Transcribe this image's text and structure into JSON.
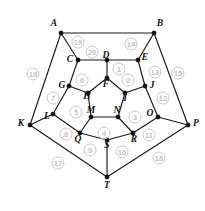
{
  "diagram": {
    "type": "planar-graph",
    "width": 205,
    "height": 211,
    "colors": {
      "edge": "#1a1a1a",
      "vertex": "#111111",
      "vertex_label": "#111111",
      "face_label": "#c2c2c2",
      "face_circle": "#c9c9c9",
      "background": "#ffffff"
    },
    "vertices": [
      {
        "id": "A",
        "label": "A",
        "x": 61,
        "y": 33,
        "lx": 54,
        "ly": 24
      },
      {
        "id": "B",
        "label": "B",
        "x": 154,
        "y": 33,
        "lx": 160,
        "ly": 24
      },
      {
        "id": "C",
        "label": "C",
        "x": 78,
        "y": 60,
        "lx": 70,
        "ly": 60
      },
      {
        "id": "D",
        "label": "D",
        "x": 107,
        "y": 60,
        "lx": 106,
        "ly": 56
      },
      {
        "id": "E",
        "label": "E",
        "x": 138,
        "y": 60,
        "lx": 145,
        "ly": 58
      },
      {
        "id": "F",
        "label": "F",
        "x": 107,
        "y": 78,
        "lx": 106,
        "ly": 85
      },
      {
        "id": "G",
        "label": "G",
        "x": 69,
        "y": 86,
        "lx": 62,
        "ly": 86
      },
      {
        "id": "H",
        "label": "H",
        "x": 88,
        "y": 93,
        "lx": 87,
        "ly": 97
      },
      {
        "id": "I",
        "label": "I",
        "x": 125,
        "y": 93,
        "lx": 125,
        "ly": 99
      },
      {
        "id": "J",
        "label": "J",
        "x": 145,
        "y": 86,
        "lx": 152,
        "ly": 86
      },
      {
        "id": "K",
        "label": "K",
        "x": 30,
        "y": 125,
        "lx": 21,
        "ly": 124
      },
      {
        "id": "L",
        "label": "L",
        "x": 53,
        "y": 114,
        "lx": 47,
        "ly": 117
      },
      {
        "id": "M",
        "label": "M",
        "x": 91,
        "y": 117,
        "lx": 91,
        "ly": 111
      },
      {
        "id": "N",
        "label": "N",
        "x": 118,
        "y": 117,
        "lx": 117,
        "ly": 111
      },
      {
        "id": "O",
        "label": "O",
        "x": 158,
        "y": 117,
        "lx": 150,
        "ly": 114
      },
      {
        "id": "P",
        "label": "P",
        "x": 188,
        "y": 125,
        "lx": 196,
        "ly": 124
      },
      {
        "id": "Q",
        "label": "Q",
        "x": 80,
        "y": 133,
        "lx": 78,
        "ly": 140
      },
      {
        "id": "R",
        "label": "R",
        "x": 133,
        "y": 133,
        "lx": 134,
        "ly": 140
      },
      {
        "id": "S",
        "label": "S",
        "x": 107,
        "y": 140,
        "lx": 107,
        "ly": 146
      },
      {
        "id": "T",
        "label": "T",
        "x": 107,
        "y": 177,
        "lx": 107,
        "ly": 186
      }
    ],
    "edges": [
      [
        "A",
        "B"
      ],
      [
        "A",
        "C"
      ],
      [
        "A",
        "K"
      ],
      [
        "B",
        "E"
      ],
      [
        "B",
        "P"
      ],
      [
        "C",
        "D"
      ],
      [
        "C",
        "G"
      ],
      [
        "D",
        "E"
      ],
      [
        "D",
        "F"
      ],
      [
        "E",
        "J"
      ],
      [
        "F",
        "H"
      ],
      [
        "F",
        "I"
      ],
      [
        "G",
        "H"
      ],
      [
        "G",
        "L"
      ],
      [
        "H",
        "M"
      ],
      [
        "I",
        "J"
      ],
      [
        "I",
        "N"
      ],
      [
        "J",
        "O"
      ],
      [
        "K",
        "L"
      ],
      [
        "K",
        "T"
      ],
      [
        "L",
        "Q"
      ],
      [
        "M",
        "N"
      ],
      [
        "M",
        "Q"
      ],
      [
        "N",
        "R"
      ],
      [
        "O",
        "P"
      ],
      [
        "O",
        "R"
      ],
      [
        "P",
        "T"
      ],
      [
        "Q",
        "S"
      ],
      [
        "R",
        "S"
      ],
      [
        "S",
        "T"
      ]
    ],
    "faces": [
      {
        "id": 1,
        "label": "1",
        "x": 119,
        "y": 69
      },
      {
        "id": 2,
        "label": "2",
        "x": 128,
        "y": 80
      },
      {
        "id": 3,
        "label": "3",
        "x": 135,
        "y": 117
      },
      {
        "id": 4,
        "label": "4",
        "x": 104,
        "y": 133
      },
      {
        "id": 5,
        "label": "5",
        "x": 76,
        "y": 112
      },
      {
        "id": 6,
        "label": "6",
        "x": 82,
        "y": 80
      },
      {
        "id": 7,
        "label": "7",
        "x": 53,
        "y": 98
      },
      {
        "id": 8,
        "label": "8",
        "x": 66,
        "y": 134
      },
      {
        "id": 9,
        "label": "9",
        "x": 90,
        "y": 150
      },
      {
        "id": 10,
        "label": "10",
        "x": 122,
        "y": 152
      },
      {
        "id": 11,
        "label": "11",
        "x": 149,
        "y": 135
      },
      {
        "id": 12,
        "label": "12",
        "x": 163,
        "y": 98
      },
      {
        "id": 13,
        "label": "13",
        "x": 155,
        "y": 72
      },
      {
        "id": 14,
        "label": "14",
        "x": 131,
        "y": 44
      },
      {
        "id": 15,
        "label": "15",
        "x": 178,
        "y": 73
      },
      {
        "id": 16,
        "label": "16",
        "x": 159,
        "y": 158
      },
      {
        "id": 17,
        "label": "17",
        "x": 58,
        "y": 163
      },
      {
        "id": 18,
        "label": "18",
        "x": 33,
        "y": 74
      },
      {
        "id": 19,
        "label": "19",
        "x": 78,
        "y": 42
      },
      {
        "id": 20,
        "label": "20",
        "x": 92,
        "y": 52
      }
    ]
  }
}
